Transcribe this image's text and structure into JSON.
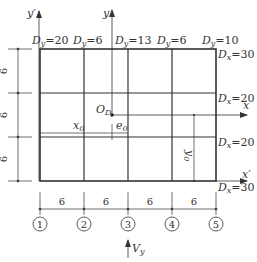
{
  "diagram": {
    "title": "",
    "top_labels": [
      {
        "var": "D",
        "sub": "y",
        "value": "=20"
      },
      {
        "var": "D",
        "sub": "y",
        "value": "=6"
      },
      {
        "var": "D",
        "sub": "y",
        "value": "=13"
      },
      {
        "var": "D",
        "sub": "y",
        "value": "=6"
      },
      {
        "var": "D",
        "sub": "y",
        "value": "=10"
      }
    ],
    "right_labels": [
      {
        "var": "D",
        "sub": "x",
        "value": "=30"
      },
      {
        "var": "D",
        "sub": "x",
        "value": "=20"
      },
      {
        "var": "D",
        "sub": "x",
        "value": "=20"
      },
      {
        "var": "D",
        "sub": "x",
        "value": "=30"
      }
    ],
    "left_dims": [
      "6",
      "6",
      "6"
    ],
    "bottom_dims": [
      "6",
      "6",
      "6",
      "6"
    ],
    "axis_labels": {
      "y_prime": "y′",
      "y": "y",
      "x": "x",
      "x_prime": "x′",
      "origin": "O",
      "origin_sub": "D"
    },
    "offsets": {
      "x0": "x",
      "x0_sub": "0",
      "e0": "e",
      "e0_sub": "0",
      "y0": "y",
      "y0_sub": "0"
    },
    "axis_numbers": [
      "1",
      "2",
      "3",
      "4",
      "5"
    ],
    "force": {
      "var": "V",
      "sub": "y"
    },
    "colors": {
      "line": "#333333",
      "background": "#ffffff"
    }
  }
}
